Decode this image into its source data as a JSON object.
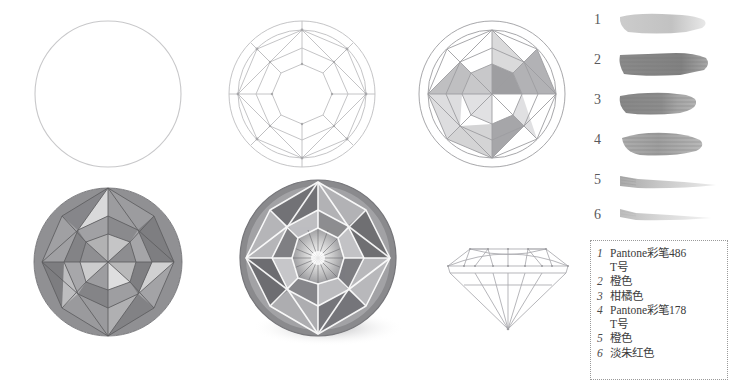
{
  "page": {
    "background": "#ffffff",
    "line_color": "#b9b9bb",
    "facet_gray": "#8e8e90"
  },
  "steps": [
    {
      "id": 1,
      "name": "circle-outline",
      "caption": ""
    },
    {
      "id": 2,
      "name": "facet-wireframe",
      "caption": ""
    },
    {
      "id": 3,
      "name": "partial-shading",
      "caption": ""
    },
    {
      "id": 4,
      "name": "full-shading",
      "caption": ""
    },
    {
      "id": 5,
      "name": "finished-rendering",
      "caption": ""
    },
    {
      "id": 6,
      "name": "side-view-wireframe",
      "caption": ""
    }
  ],
  "swatch_chart": {
    "name": "color-swatch-chart",
    "swatches": [
      {
        "number": "1",
        "tone": "#cacaca",
        "opacity": 0.85,
        "shape": "block"
      },
      {
        "number": "2",
        "tone": "#8a8a8a",
        "opacity": 1.0,
        "shape": "block"
      },
      {
        "number": "3",
        "tone": "#8f8f8f",
        "opacity": 1.0,
        "shape": "block"
      },
      {
        "number": "4",
        "tone": "#a6a6a6",
        "opacity": 1.0,
        "shape": "block"
      },
      {
        "number": "5",
        "tone": "#bdbdbd",
        "opacity": 0.8,
        "shape": "taper"
      },
      {
        "number": "6",
        "tone": "#cfcfcf",
        "opacity": 0.7,
        "shape": "taper"
      }
    ]
  },
  "legend": {
    "name": "color-legend",
    "border_style": "dotted",
    "items": [
      {
        "index": "1",
        "text": "Pantone彩笔486\nT号"
      },
      {
        "index": "2",
        "text": "橙色"
      },
      {
        "index": "3",
        "text": "柑橘色"
      },
      {
        "index": "4",
        "text": "Pantone彩笔178\nT号"
      },
      {
        "index": "5",
        "text": "橙色"
      },
      {
        "index": "6",
        "text": "淡朱红色"
      }
    ]
  }
}
